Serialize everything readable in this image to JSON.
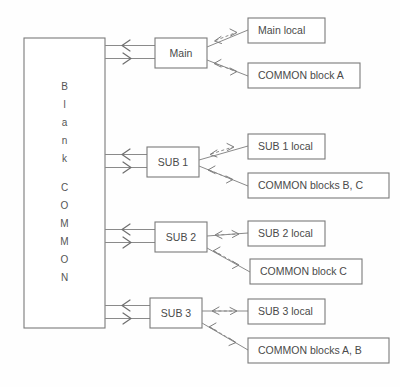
{
  "diagram": {
    "common_block": {
      "label": "Blank COMMON",
      "letters": [
        "B",
        "l",
        "a",
        "n",
        "k",
        "",
        "C",
        "O",
        "M",
        "M",
        "O",
        "N"
      ]
    },
    "units": [
      {
        "id": "main",
        "label": "Main",
        "targets": [
          {
            "id": "main-local",
            "label": "Main local"
          },
          {
            "id": "common-block-a",
            "label": "COMMON block A"
          }
        ]
      },
      {
        "id": "sub1",
        "label": "SUB 1",
        "targets": [
          {
            "id": "sub1-local",
            "label": "SUB 1 local"
          },
          {
            "id": "common-blocks-bc",
            "label": "COMMON blocks B, C"
          }
        ]
      },
      {
        "id": "sub2",
        "label": "SUB 2",
        "targets": [
          {
            "id": "sub2-local",
            "label": "SUB 2 local"
          },
          {
            "id": "common-block-c",
            "label": "COMMON block C"
          }
        ]
      },
      {
        "id": "sub3",
        "label": "SUB 3",
        "targets": [
          {
            "id": "sub3-local",
            "label": "SUB 3 local"
          },
          {
            "id": "common-blocks-ab",
            "label": "COMMON blocks A, B"
          }
        ]
      }
    ],
    "colors": {
      "box_stroke": "#7a7a7a",
      "line": "#8a8a8a",
      "text": "#4a4a4a",
      "background": "#fefefe"
    }
  }
}
